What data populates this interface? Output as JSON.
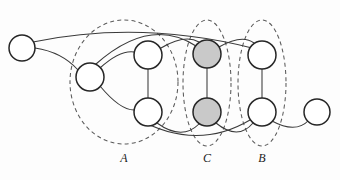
{
  "figure": {
    "canvas": {
      "width": 340,
      "height": 180
    },
    "colors": {
      "background": "#fdfdfd",
      "node_fill_empty": "#ffffff",
      "node_fill_shaded": "#c9c9c9",
      "node_stroke": "#262626",
      "edge_stroke": "#3a3a3a",
      "cluster_stroke": "#5a5a5a",
      "label_color": "#1c1c1c"
    },
    "nodes": [
      {
        "id": "n1",
        "cx": 22,
        "cy": 48,
        "r": 13,
        "shaded": false
      },
      {
        "id": "n2",
        "cx": 90,
        "cy": 77,
        "r": 14,
        "shaded": false
      },
      {
        "id": "n3",
        "cx": 148,
        "cy": 55,
        "r": 14,
        "shaded": false
      },
      {
        "id": "n4",
        "cx": 148,
        "cy": 112,
        "r": 14,
        "shaded": false
      },
      {
        "id": "n5",
        "cx": 207,
        "cy": 54,
        "r": 14,
        "shaded": true
      },
      {
        "id": "n6",
        "cx": 207,
        "cy": 112,
        "r": 14,
        "shaded": true
      },
      {
        "id": "n7",
        "cx": 262,
        "cy": 55,
        "r": 14,
        "shaded": false
      },
      {
        "id": "n8",
        "cx": 262,
        "cy": 112,
        "r": 14,
        "shaded": false
      },
      {
        "id": "n9",
        "cx": 317,
        "cy": 112,
        "r": 13,
        "shaded": false
      }
    ],
    "edges": [
      {
        "id": "e1",
        "from": "n1",
        "to": "n2",
        "path": "M 35 48 Q 62 52 78 70"
      },
      {
        "id": "e2",
        "from": "n2",
        "to": "n3",
        "path": "M 100 68 Q 120 50 134 52"
      },
      {
        "id": "e3",
        "from": "n2",
        "to": "n4",
        "path": "M 100 86 Q 120 110 134 110"
      },
      {
        "id": "e4",
        "from": "n3",
        "to": "n4",
        "path": "M 148 69 L 148 98"
      },
      {
        "id": "e5",
        "from": "n5",
        "to": "n6",
        "path": "M 207 68 L 207 98"
      },
      {
        "id": "e6",
        "from": "n7",
        "to": "n8",
        "path": "M 262 69 L 262 98"
      },
      {
        "id": "e7",
        "from": "n3",
        "to": "n5",
        "path": "M 161 48 Q 185 34 199 42"
      },
      {
        "id": "e8",
        "from": "n5",
        "to": "n7",
        "path": "M 219 47 Q 242 34 254 43"
      },
      {
        "id": "e9",
        "from": "n4",
        "to": "n6",
        "path": "M 157 123 Q 182 141 199 124"
      },
      {
        "id": "e10",
        "from": "n6",
        "to": "n8",
        "path": "M 216 123 Q 238 141 253 123"
      },
      {
        "id": "e11",
        "from": "n8",
        "to": "n9",
        "path": "M 272 121 Q 296 134 309 120"
      },
      {
        "id": "e12",
        "from": "n2",
        "to": "n6",
        "path": "M 96 64 Q 150 16 196 46"
      },
      {
        "id": "e13",
        "from": "n1",
        "to": "n7",
        "path": "M 33 42 Q 140 20 252 48"
      },
      {
        "id": "e14",
        "from": "n4",
        "to": "n8",
        "path": "M 136 118 Q 196 152 250 120"
      }
    ],
    "clusters": [
      {
        "id": "cluster-a",
        "label": "A",
        "cx": 124,
        "cy": 82,
        "rx": 54,
        "ry": 62,
        "label_x": 124,
        "label_y": 162
      },
      {
        "id": "cluster-c",
        "label": "C",
        "cx": 207,
        "cy": 83,
        "rx": 24,
        "ry": 63,
        "label_x": 207,
        "label_y": 162
      },
      {
        "id": "cluster-b",
        "label": "B",
        "cx": 262,
        "cy": 83,
        "rx": 24,
        "ry": 63,
        "label_x": 262,
        "label_y": 162
      }
    ]
  }
}
